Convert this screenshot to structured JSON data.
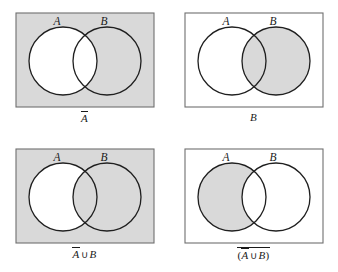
{
  "figure": {
    "type": "venn-diagram-set",
    "panel_count": 4,
    "colors": {
      "shade": "#d9d9d9",
      "stroke": "#1f1f1f",
      "rect_stroke": "#6f6f6f",
      "background": "#ffffff",
      "text": "#1a1a1a"
    },
    "geometry": {
      "rect": {
        "x": 16,
        "y": 13,
        "width": 138,
        "height": 94
      },
      "circle_a": {
        "cx": 63,
        "cy": 61,
        "r": 34
      },
      "circle_b": {
        "cx": 107,
        "cy": 61,
        "r": 34
      },
      "label_a": {
        "x": 57,
        "y": 24
      },
      "label_b": {
        "x": 105,
        "y": 24
      }
    },
    "panels": [
      {
        "id": "panel-a-complement",
        "position": "top-left",
        "label_a": "A",
        "label_b": "B",
        "caption_plain": "Ā",
        "caption_parts": [
          {
            "text": "A",
            "style": "italic",
            "overline": true
          }
        ],
        "shaded_region": "universe-minus-A",
        "universe_shaded": true,
        "region_a_only_shaded": false,
        "region_intersection_shaded": true,
        "region_b_only_shaded": true
      },
      {
        "id": "panel-b",
        "position": "top-right",
        "label_a": "A",
        "label_b": "B",
        "caption_plain": "B",
        "caption_parts": [
          {
            "text": "B",
            "style": "italic",
            "overline": false
          }
        ],
        "shaded_region": "B",
        "universe_shaded": false,
        "region_a_only_shaded": false,
        "region_intersection_shaded": true,
        "region_b_only_shaded": true
      },
      {
        "id": "panel-a-complement-union-b",
        "position": "bottom-left",
        "label_a": "A",
        "label_b": "B",
        "caption_plain": "Ā ∪ B",
        "caption_parts": [
          {
            "text": "A",
            "style": "italic",
            "overline": true
          },
          {
            "text": "∪",
            "style": "operator",
            "overline": false
          },
          {
            "text": "B",
            "style": "italic",
            "overline": false
          }
        ],
        "shaded_region": "universe-minus-(A-only)",
        "universe_shaded": true,
        "region_a_only_shaded": false,
        "region_intersection_shaded": true,
        "region_b_only_shaded": true
      },
      {
        "id": "panel-complement-of-a-complement-union-b",
        "position": "bottom-right",
        "label_a": "A",
        "label_b": "B",
        "caption_plain": "(Ā ∪ B)̅",
        "caption_parts": [
          {
            "text": "(",
            "style": "paren",
            "overline": false
          },
          {
            "text": "A",
            "style": "italic",
            "overline": true
          },
          {
            "text": "∪",
            "style": "operator",
            "overline": false
          },
          {
            "text": "B",
            "style": "italic",
            "overline": false
          },
          {
            "text": ")",
            "style": "paren",
            "overline": false
          }
        ],
        "outer_overline": true,
        "shaded_region": "A-only",
        "universe_shaded": false,
        "region_a_only_shaded": true,
        "region_intersection_shaded": false,
        "region_b_only_shaded": false
      }
    ]
  }
}
